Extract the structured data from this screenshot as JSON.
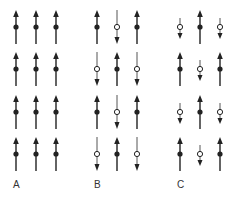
{
  "panels": [
    {
      "label": "A",
      "x0": 16,
      "grid": [
        [
          "up",
          "up",
          "up"
        ],
        [
          "up",
          "up",
          "up"
        ],
        [
          "up",
          "up",
          "up"
        ],
        [
          "up",
          "up",
          "up"
        ]
      ]
    },
    {
      "label": "B",
      "x0": 97,
      "grid": [
        [
          "up",
          "down",
          "up"
        ],
        [
          "down",
          "up",
          "down"
        ],
        [
          "up",
          "down",
          "up"
        ],
        [
          "down",
          "up",
          "down"
        ]
      ]
    },
    {
      "label": "C",
      "x0": 180,
      "grid": [
        [
          "short-down",
          "up",
          "short-down"
        ],
        [
          "up",
          "short-down",
          "up"
        ],
        [
          "short-down",
          "up",
          "short-down"
        ],
        [
          "up",
          "short-down",
          "up"
        ]
      ]
    }
  ],
  "legend": {
    "up": "spin up (filled dot)",
    "down": "spin down (open dot)",
    "short-down": "reduced spin down (open dot, short)"
  },
  "colors": {
    "stroke": "#222222",
    "open_fill": "#ffffff"
  }
}
